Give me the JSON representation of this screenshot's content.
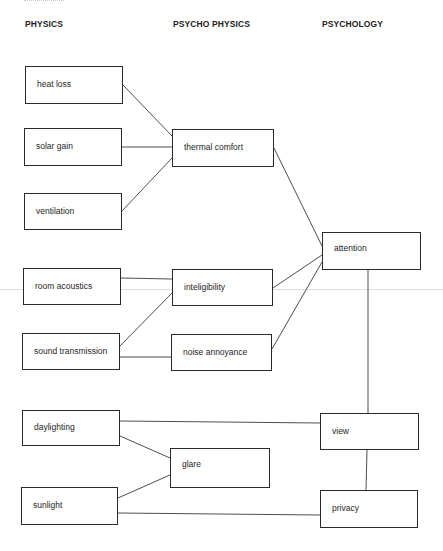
{
  "diagram": {
    "columns": [
      {
        "id": "physics",
        "label": "PHYSICS"
      },
      {
        "id": "psychophysics",
        "label": "PSYCHO PHYSICS"
      },
      {
        "id": "psychology",
        "label": "PSYCHOLOGY"
      }
    ],
    "nodes": {
      "heat_loss": "heat loss",
      "solar_gain": "solar gain",
      "ventilation": "ventilation",
      "room_acoustics": "room acoustics",
      "sound_transmission": "sound transmission",
      "daylighting": "daylighting",
      "sunlight": "sunlight",
      "thermal_comfort": "thermal comfort",
      "inteligibility": "inteligibility",
      "noise_annoyance": "noise annoyance",
      "glare": "glare",
      "attention": "attention",
      "view": "view",
      "privacy": "privacy"
    },
    "edges": [
      [
        "heat_loss",
        "thermal_comfort"
      ],
      [
        "solar_gain",
        "thermal_comfort"
      ],
      [
        "ventilation",
        "thermal_comfort"
      ],
      [
        "thermal_comfort",
        "attention"
      ],
      [
        "room_acoustics",
        "inteligibility"
      ],
      [
        "sound_transmission",
        "inteligibility"
      ],
      [
        "sound_transmission",
        "noise_annoyance"
      ],
      [
        "inteligibility",
        "attention"
      ],
      [
        "noise_annoyance",
        "attention"
      ],
      [
        "attention",
        "view"
      ],
      [
        "daylighting",
        "view"
      ],
      [
        "daylighting",
        "glare"
      ],
      [
        "sunlight",
        "glare"
      ],
      [
        "sunlight",
        "privacy"
      ],
      [
        "view",
        "privacy"
      ]
    ]
  }
}
